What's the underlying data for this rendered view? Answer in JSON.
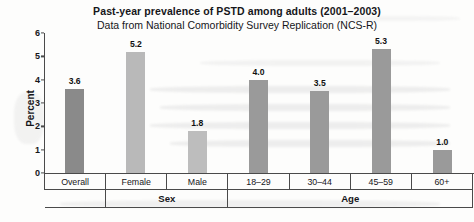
{
  "header": {
    "title": "Past-year prevalence of PSTD among adults (2001–2003)",
    "subtitle": "Data from National Comorbidity Survey Replication (NCS-R)"
  },
  "chart_data": {
    "type": "bar",
    "title": "Past-year prevalence of PSTD among adults (2001–2003)",
    "subtitle": "Data from National Comorbidity Survey Replication (NCS-R)",
    "xlabel": "",
    "ylabel": "Percent",
    "ylim": [
      0,
      6
    ],
    "yticks": [
      "0",
      "1",
      "2",
      "3",
      "4",
      "5",
      "6"
    ],
    "grid": false,
    "legend": "none",
    "categories": [
      "Overall",
      "Female",
      "Male",
      "18–29",
      "30–44",
      "45–59",
      "60+"
    ],
    "values": [
      3.6,
      5.2,
      1.8,
      4.0,
      3.5,
      5.3,
      1.0
    ],
    "value_labels": [
      "3.6",
      "5.2",
      "1.8",
      "4.0",
      "3.5",
      "5.3",
      "1.0"
    ],
    "bar_colors": [
      "#8a8a8a",
      "#b9b9b9",
      "#bdbdbd",
      "#9a9a9a",
      "#9a9a9a",
      "#9a9a9a",
      "#9a9a9a"
    ],
    "groups": [
      {
        "label": "",
        "span": 1
      },
      {
        "label": "Sex",
        "span": 2
      },
      {
        "label": "Age",
        "span": 4
      }
    ]
  }
}
